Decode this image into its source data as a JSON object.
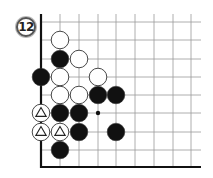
{
  "diagram": {
    "number_label": "12",
    "grid": {
      "columns_x": [
        41,
        60,
        79,
        98,
        116,
        135,
        154,
        173,
        191
      ],
      "rows_y": [
        22,
        40,
        59,
        77,
        95,
        113,
        132,
        150,
        167
      ],
      "right_extent": 201,
      "top_extent": 14,
      "line_color": "#999999",
      "edge_color": "#111111"
    },
    "stone_radius": 8.8,
    "colors": {
      "black": "#111111",
      "white": "#ffffff",
      "outline": "#333333"
    },
    "stones": [
      {
        "color": "white",
        "col": 1,
        "row": 1
      },
      {
        "color": "black",
        "col": 1,
        "row": 2
      },
      {
        "color": "white",
        "col": 2,
        "row": 2
      },
      {
        "color": "black",
        "col": 0,
        "row": 3
      },
      {
        "color": "white",
        "col": 1,
        "row": 3
      },
      {
        "color": "white",
        "col": 3,
        "row": 3
      },
      {
        "color": "white",
        "col": 1,
        "row": 4
      },
      {
        "color": "white",
        "col": 2,
        "row": 4
      },
      {
        "color": "black",
        "col": 3,
        "row": 4
      },
      {
        "color": "black",
        "col": 4,
        "row": 4
      },
      {
        "color": "white",
        "col": 0,
        "row": 5,
        "mark": "triangle"
      },
      {
        "color": "black",
        "col": 1,
        "row": 5
      },
      {
        "color": "black",
        "col": 2,
        "row": 5
      },
      {
        "color": "white",
        "col": 0,
        "row": 6,
        "mark": "triangle"
      },
      {
        "color": "white",
        "col": 1,
        "row": 6,
        "mark": "triangle"
      },
      {
        "color": "black",
        "col": 2,
        "row": 6
      },
      {
        "color": "black",
        "col": 4,
        "row": 6
      },
      {
        "color": "black",
        "col": 1,
        "row": 7
      }
    ],
    "points": [
      {
        "type": "small-dot",
        "col": 3,
        "row": 5
      }
    ]
  }
}
